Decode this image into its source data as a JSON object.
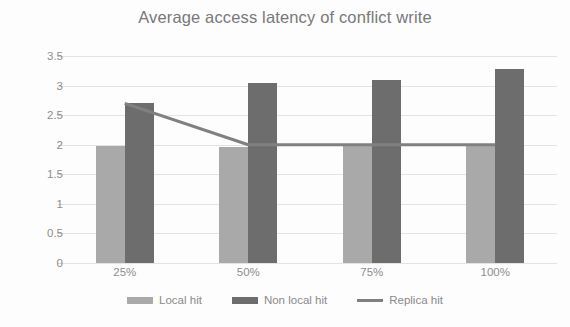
{
  "chart_data": {
    "type": "bar",
    "title": "Average access latency of conflict write",
    "xlabel": "",
    "ylabel": "",
    "categories": [
      "25%",
      "50%",
      "75%",
      "100%"
    ],
    "ylim": [
      0,
      3.5
    ],
    "yticks": [
      0,
      0.5,
      1,
      1.5,
      2,
      2.5,
      3,
      3.5
    ],
    "ytick_labels": [
      "0",
      "0.5",
      "1",
      "1.5",
      "2",
      "2.5",
      "3",
      "3.5"
    ],
    "grid": true,
    "legend_position": "bottom",
    "series": [
      {
        "name": "Local hit",
        "kind": "bar",
        "color": "#a9a9a9",
        "values": [
          1.98,
          1.97,
          1.98,
          1.98
        ]
      },
      {
        "name": "Non local hit",
        "kind": "bar",
        "color": "#6d6d6d",
        "values": [
          2.7,
          3.04,
          3.1,
          3.28
        ]
      },
      {
        "name": "Replica hit",
        "kind": "line",
        "color": "#808080",
        "values": [
          2.7,
          2.0,
          2.0,
          2.0
        ]
      }
    ]
  },
  "legend": {
    "items": [
      {
        "label": "Local hit",
        "color": "#a9a9a9",
        "marker": "bar-swatch"
      },
      {
        "label": "Non local hit",
        "color": "#6d6d6d",
        "marker": "bar-swatch"
      },
      {
        "label": "Replica hit",
        "color": "#808080",
        "marker": "line-swatch"
      }
    ]
  }
}
